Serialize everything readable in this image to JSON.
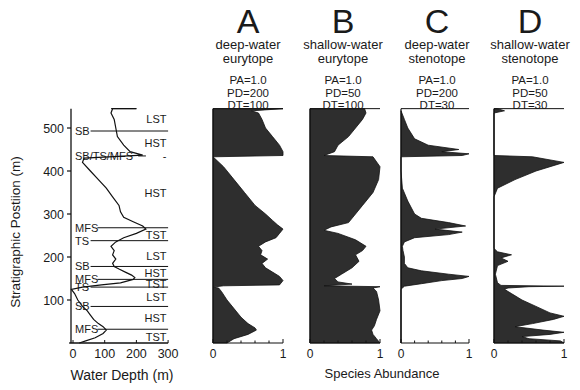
{
  "chart_data": [
    {
      "type": "line",
      "title": "",
      "xlabel": "Water Depth (m)",
      "ylabel": "Stratigraphic Postiion (m)",
      "xlim": [
        -10,
        300
      ],
      "ylim": [
        0,
        545
      ],
      "xticks": [
        0,
        100,
        200,
        300
      ],
      "yticks": [
        100,
        200,
        300,
        400,
        500
      ],
      "grid": false,
      "series": [
        {
          "name": "water depth",
          "points": [
            [
              20,
              0
            ],
            [
              40,
              5
            ],
            [
              70,
              12
            ],
            [
              95,
              22
            ],
            [
              105,
              30
            ],
            [
              95,
              38
            ],
            [
              80,
              45
            ],
            [
              65,
              55
            ],
            [
              55,
              65
            ],
            [
              45,
              75
            ],
            [
              30,
              85
            ],
            [
              15,
              100
            ],
            [
              5,
              115
            ],
            [
              -5,
              125
            ],
            [
              30,
              130
            ],
            [
              90,
              135
            ],
            [
              150,
              140
            ],
            [
              190,
              148
            ],
            [
              195,
              152
            ],
            [
              185,
              158
            ],
            [
              165,
              165
            ],
            [
              145,
              172
            ],
            [
              130,
              178
            ],
            [
              125,
              185
            ],
            [
              135,
              195
            ],
            [
              125,
              205
            ],
            [
              130,
              215
            ],
            [
              120,
              225
            ],
            [
              135,
              235
            ],
            [
              160,
              245
            ],
            [
              200,
              255
            ],
            [
              230,
              265
            ],
            [
              220,
              272
            ],
            [
              190,
              282
            ],
            [
              160,
              292
            ],
            [
              150,
              305
            ],
            [
              145,
              320
            ],
            [
              125,
              340
            ],
            [
              105,
              360
            ],
            [
              80,
              380
            ],
            [
              55,
              400
            ],
            [
              30,
              420
            ],
            [
              35,
              430
            ],
            [
              220,
              437
            ],
            [
              180,
              445
            ],
            [
              160,
              460
            ],
            [
              140,
              480
            ],
            [
              135,
              500
            ],
            [
              130,
              520
            ],
            [
              120,
              535
            ],
            [
              125,
              545
            ],
            [
              200,
              545
            ]
          ]
        }
      ],
      "annotations": {
        "surfaces": [
          {
            "label": "SB",
            "pos": 493
          },
          {
            "label": "SB/TS/MFS",
            "pos": 435
          },
          {
            "label": "MFS",
            "pos": 268
          },
          {
            "label": "TS",
            "pos": 238
          },
          {
            "label": "SB",
            "pos": 178
          },
          {
            "label": "MFS",
            "pos": 148
          },
          {
            "label": "TS",
            "pos": 130
          },
          {
            "label": "SB",
            "pos": 85
          },
          {
            "label": "MFS",
            "pos": 32
          }
        ],
        "systems_tracts": [
          {
            "label": "LST",
            "pos": 520
          },
          {
            "label": "HST",
            "pos": 465
          },
          {
            "label": "-",
            "pos": 435
          },
          {
            "label": "HST",
            "pos": 350
          },
          {
            "label": "TST",
            "pos": 252
          },
          {
            "label": "LST",
            "pos": 203
          },
          {
            "label": "HST",
            "pos": 163
          },
          {
            "label": "TST",
            "pos": 138
          },
          {
            "label": "LST",
            "pos": 107
          },
          {
            "label": "HST",
            "pos": 58
          },
          {
            "label": "TST",
            "pos": 15
          }
        ]
      }
    },
    {
      "type": "area",
      "title": "A deep-water eurytope",
      "params": {
        "PA": 1.0,
        "PD": 200,
        "DT": 100
      },
      "xlabel": "Species Abundance",
      "xlim": [
        0,
        1
      ],
      "xticks": [
        0,
        1
      ],
      "points": [
        [
          0,
          0.2
        ],
        [
          10,
          0.3
        ],
        [
          20,
          0.5
        ],
        [
          30,
          0.62
        ],
        [
          35,
          0.6
        ],
        [
          45,
          0.5
        ],
        [
          60,
          0.4
        ],
        [
          80,
          0.3
        ],
        [
          100,
          0.2
        ],
        [
          120,
          0.12
        ],
        [
          128,
          0.08
        ],
        [
          130,
          0.0
        ],
        [
          133,
          0.15
        ],
        [
          135,
          0.95
        ],
        [
          145,
          1.0
        ],
        [
          155,
          0.95
        ],
        [
          165,
          0.85
        ],
        [
          175,
          0.75
        ],
        [
          185,
          0.7
        ],
        [
          195,
          0.78
        ],
        [
          205,
          0.68
        ],
        [
          215,
          0.7
        ],
        [
          225,
          0.65
        ],
        [
          235,
          0.75
        ],
        [
          245,
          0.9
        ],
        [
          255,
          0.95
        ],
        [
          265,
          1.0
        ],
        [
          275,
          0.92
        ],
        [
          285,
          0.85
        ],
        [
          300,
          0.75
        ],
        [
          320,
          0.6
        ],
        [
          350,
          0.45
        ],
        [
          380,
          0.3
        ],
        [
          410,
          0.15
        ],
        [
          433,
          0.0
        ],
        [
          436,
          1.0
        ],
        [
          445,
          1.0
        ],
        [
          460,
          0.95
        ],
        [
          480,
          0.85
        ],
        [
          500,
          0.75
        ],
        [
          520,
          0.7
        ],
        [
          535,
          0.65
        ],
        [
          540,
          0.55
        ],
        [
          545,
          1.0
        ]
      ]
    },
    {
      "type": "area",
      "title": "B shallow-water eurytope",
      "params": {
        "PA": 1.0,
        "PD": 50,
        "DT": 100
      },
      "xlabel": "Species Abundance",
      "xlim": [
        0,
        1
      ],
      "xticks": [
        0,
        1
      ],
      "points": [
        [
          0,
          1.0
        ],
        [
          10,
          0.95
        ],
        [
          20,
          0.9
        ],
        [
          30,
          0.88
        ],
        [
          40,
          0.92
        ],
        [
          55,
          0.95
        ],
        [
          75,
          1.0
        ],
        [
          100,
          0.98
        ],
        [
          120,
          0.95
        ],
        [
          128,
          0.9
        ],
        [
          131,
          1.0
        ],
        [
          133,
          0.2
        ],
        [
          137,
          0.6
        ],
        [
          142,
          0.4
        ],
        [
          150,
          0.35
        ],
        [
          160,
          0.45
        ],
        [
          175,
          0.6
        ],
        [
          190,
          0.7
        ],
        [
          205,
          0.65
        ],
        [
          215,
          0.75
        ],
        [
          225,
          0.8
        ],
        [
          240,
          0.65
        ],
        [
          255,
          0.4
        ],
        [
          262,
          0.2
        ],
        [
          270,
          0.3
        ],
        [
          280,
          0.55
        ],
        [
          300,
          0.65
        ],
        [
          320,
          0.75
        ],
        [
          350,
          0.9
        ],
        [
          380,
          0.98
        ],
        [
          410,
          1.0
        ],
        [
          433,
          0.9
        ],
        [
          436,
          0.2
        ],
        [
          445,
          0.35
        ],
        [
          460,
          0.4
        ],
        [
          480,
          0.55
        ],
        [
          500,
          0.65
        ],
        [
          520,
          0.75
        ],
        [
          535,
          0.8
        ],
        [
          545,
          0.78
        ]
      ]
    },
    {
      "type": "area",
      "title": "C deep-water stenotope",
      "params": {
        "PA": 1.0,
        "PD": 200,
        "DT": 30
      },
      "xlabel": "Species Abundance",
      "xlim": [
        0,
        1
      ],
      "xticks": [
        0,
        1
      ],
      "points": [
        [
          0,
          0.0
        ],
        [
          125,
          0.0
        ],
        [
          128,
          0.02
        ],
        [
          132,
          0.05
        ],
        [
          138,
          0.3
        ],
        [
          145,
          0.6
        ],
        [
          150,
          0.9
        ],
        [
          155,
          1.0
        ],
        [
          160,
          0.7
        ],
        [
          168,
          0.3
        ],
        [
          175,
          0.1
        ],
        [
          185,
          0.05
        ],
        [
          200,
          0.05
        ],
        [
          215,
          0.03
        ],
        [
          225,
          0.02
        ],
        [
          235,
          0.05
        ],
        [
          245,
          0.2
        ],
        [
          252,
          0.7
        ],
        [
          258,
          0.9
        ],
        [
          265,
          0.5
        ],
        [
          272,
          0.95
        ],
        [
          280,
          0.7
        ],
        [
          290,
          0.3
        ],
        [
          300,
          0.2
        ],
        [
          330,
          0.1
        ],
        [
          360,
          0.02
        ],
        [
          400,
          0.0
        ],
        [
          433,
          0.0
        ],
        [
          436,
          0.9
        ],
        [
          440,
          1.0
        ],
        [
          445,
          0.6
        ],
        [
          450,
          0.85
        ],
        [
          460,
          0.4
        ],
        [
          475,
          0.2
        ],
        [
          500,
          0.1
        ],
        [
          520,
          0.05
        ],
        [
          540,
          0.0
        ]
      ]
    },
    {
      "type": "area",
      "title": "D shallow-water stenotope",
      "params": {
        "PA": 1.0,
        "PD": 50,
        "DT": 30
      },
      "xlabel": "Species Abundance",
      "xlim": [
        0,
        1
      ],
      "xticks": [
        0,
        1
      ],
      "points": [
        [
          0,
          1.0
        ],
        [
          5,
          0.95
        ],
        [
          10,
          0.5
        ],
        [
          15,
          0.4
        ],
        [
          20,
          0.8
        ],
        [
          25,
          1.0
        ],
        [
          30,
          0.7
        ],
        [
          38,
          0.3
        ],
        [
          45,
          0.55
        ],
        [
          55,
          0.85
        ],
        [
          62,
          1.0
        ],
        [
          70,
          0.8
        ],
        [
          85,
          0.6
        ],
        [
          100,
          0.4
        ],
        [
          115,
          0.25
        ],
        [
          125,
          0.15
        ],
        [
          128,
          0.2
        ],
        [
          131,
          0.5
        ],
        [
          132,
          1.0
        ],
        [
          134,
          0.1
        ],
        [
          140,
          0.05
        ],
        [
          160,
          0.02
        ],
        [
          180,
          0.05
        ],
        [
          190,
          0.2
        ],
        [
          198,
          0.1
        ],
        [
          205,
          0.25
        ],
        [
          212,
          0.05
        ],
        [
          220,
          0.0
        ],
        [
          340,
          0.0
        ],
        [
          360,
          0.05
        ],
        [
          380,
          0.3
        ],
        [
          400,
          0.6
        ],
        [
          420,
          1.0
        ],
        [
          433,
          0.55
        ],
        [
          436,
          0.0
        ],
        [
          535,
          0.0
        ],
        [
          540,
          0.15
        ],
        [
          545,
          0.05
        ]
      ]
    }
  ],
  "panels": [
    {
      "letter": "A",
      "line1": "deep-water",
      "line2": "eurytope",
      "pa": "PA=1.0",
      "pd": "PD=200",
      "dt": "DT=100"
    },
    {
      "letter": "B",
      "line1": "shallow-water",
      "line2": "eurytope",
      "pa": "PA=1.0",
      "pd": "PD=50",
      "dt": "DT=100"
    },
    {
      "letter": "C",
      "line1": "deep-water",
      "line2": "stenotope",
      "pa": "PA=1.0",
      "pd": "PD=200",
      "dt": "DT=30"
    },
    {
      "letter": "D",
      "line1": "shallow-water",
      "line2": "stenotope",
      "pa": "PA=1.0",
      "pd": "PD=50",
      "dt": "DT=30"
    }
  ],
  "axes": {
    "left_xlabel": "Water Depth (m)",
    "left_ylabel": "Stratigraphic Postiion (m)",
    "right_xlabel": "Species Abundance",
    "left_xticks": [
      "0",
      "100",
      "200",
      "300"
    ],
    "left_yticks": [
      "100",
      "200",
      "300",
      "400",
      "500"
    ],
    "panel_xticks": [
      "0",
      "1"
    ]
  },
  "colors": {
    "fill": "#2e2e2e",
    "line": "#111111",
    "bg": "#ffffff"
  }
}
